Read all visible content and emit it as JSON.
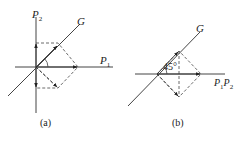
{
  "figure": {
    "panel_a": {
      "caption": "(a)",
      "labels": {
        "vertical_axis": "P",
        "vertical_axis_sub": "2",
        "horizontal_axis": "P",
        "horizontal_axis_sub": "1",
        "line": "G"
      }
    },
    "panel_b": {
      "caption": "(b)",
      "labels": {
        "horizontal_axis_a": "P",
        "horizontal_axis_a_sub": "1",
        "horizontal_axis_b": "P",
        "horizontal_axis_b_sub": "2",
        "line": "G",
        "angle": "45°"
      }
    },
    "colors": {
      "line": "#333333",
      "dashed": "#444444"
    }
  }
}
